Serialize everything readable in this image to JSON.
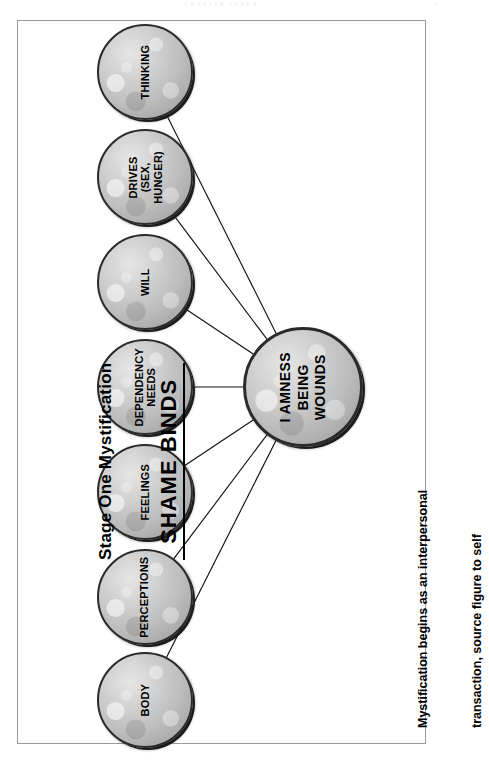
{
  "page": {
    "header_text": "CHAPTER  SEVEN",
    "folio": "9"
  },
  "title": {
    "line1": "Stage One Mystification",
    "line2": "SHAME BINDS"
  },
  "center_node": {
    "label": "I AMNESS\nBEING\nWOUNDS"
  },
  "nodes": [
    {
      "label": "THINKING"
    },
    {
      "label": "DRIVES\n(SEX,\nHUNGER)"
    },
    {
      "label": "WILL"
    },
    {
      "label": "DEPENDENCY\nNEEDS"
    },
    {
      "label": "FEELINGS"
    },
    {
      "label": "PERCEPTIONS"
    },
    {
      "label": "BODY"
    }
  ],
  "caption": {
    "line1": "Mystification begins as an interpersonal",
    "line2": "transaction, source figure to self"
  },
  "colors": {
    "frame_border": "#9a9a9a",
    "node_outline": "#2a2a2a",
    "node_fill_light": "#e6e6e6",
    "node_fill_dark": "#9a9a9a",
    "connector_line": "#111111",
    "text": "#000000",
    "background": "#ffffff"
  },
  "geometry": {
    "hub_center_x": 303,
    "hub_center_y": 387,
    "hub_radius": 60,
    "satellite_center_x": 145,
    "satellite_radius": 48,
    "satellite_centers_y": [
      72,
      177,
      282,
      387,
      492,
      597,
      700
    ]
  }
}
